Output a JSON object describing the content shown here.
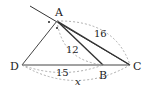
{
  "diagram": {
    "type": "geometry-triangle-exterior-angle-bisector",
    "points": {
      "A": {
        "label": "A",
        "x": 57,
        "y": 21
      },
      "B": {
        "label": "B",
        "x": 103,
        "y": 65
      },
      "C": {
        "label": "C",
        "x": 130,
        "y": 65
      },
      "D": {
        "label": "D",
        "x": 22,
        "y": 65
      }
    },
    "measurements": {
      "AC": "16",
      "AB": "12",
      "DB": "15",
      "DC": "x"
    },
    "colors": {
      "line": "#333333",
      "dashed": "#999999",
      "text": "#222222"
    }
  }
}
